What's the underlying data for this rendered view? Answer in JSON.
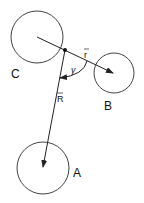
{
  "diagram": {
    "stroke_color": "#222222",
    "bodies": [
      {
        "id": "C",
        "label": "C",
        "cx": 37,
        "cy": 37,
        "r": 26,
        "label_x": 16,
        "label_y": 77
      },
      {
        "id": "B",
        "label": "B",
        "cx": 114,
        "cy": 73,
        "r": 20,
        "label_x": 104,
        "label_y": 110
      },
      {
        "id": "A",
        "label": "A",
        "cx": 43,
        "cy": 168,
        "r": 26,
        "label_x": 73,
        "label_y": 177
      }
    ],
    "point": {
      "x": 65,
      "y": 50
    },
    "vectors": {
      "r": {
        "label": "r",
        "from": "C",
        "to": "B"
      },
      "R": {
        "label": "R",
        "from": "point",
        "to": "A"
      }
    },
    "angle": {
      "label": "γ"
    }
  }
}
